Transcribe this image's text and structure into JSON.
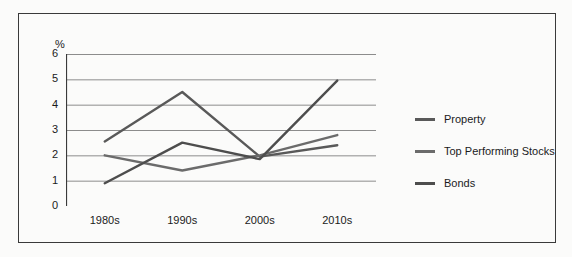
{
  "chart_data": {
    "type": "line",
    "title": "",
    "xlabel": "",
    "ylabel": "%",
    "categories": [
      "1980s",
      "1990s",
      "2000s",
      "2010s"
    ],
    "ylim": [
      0,
      6
    ],
    "yticks": [
      0,
      1,
      2,
      3,
      4,
      5,
      6
    ],
    "grid": true,
    "legend_position": "right",
    "series": [
      {
        "name": "Property",
        "color": "#595959",
        "values": [
          2.55,
          4.5,
          1.95,
          2.4
        ]
      },
      {
        "name": "Top Performing Stocks",
        "color": "#6b6b6b",
        "values": [
          2.0,
          1.4,
          2.0,
          2.8
        ]
      },
      {
        "name": "Bonds",
        "color": "#4d4d4d",
        "values": [
          0.9,
          2.5,
          1.85,
          4.95
        ]
      }
    ]
  },
  "axis": {
    "y_unit_label": "%",
    "tick_labels": {
      "y": [
        "6",
        "5",
        "4",
        "3",
        "2",
        "1",
        "0"
      ],
      "x": [
        "1980s",
        "1990s",
        "2000s",
        "2010s"
      ]
    }
  },
  "legend": {
    "items": [
      {
        "label": "Property",
        "color": "#595959"
      },
      {
        "label": "Top Performing Stocks",
        "color": "#6b6b6b"
      },
      {
        "label": "Bonds",
        "color": "#4d4d4d"
      }
    ]
  },
  "colors": {
    "background": "#fbfbfa",
    "frame": "#3a3a3a",
    "axis": "#3a3a3a",
    "gridline": "#8c8c8c",
    "text": "#1a1a1a"
  }
}
